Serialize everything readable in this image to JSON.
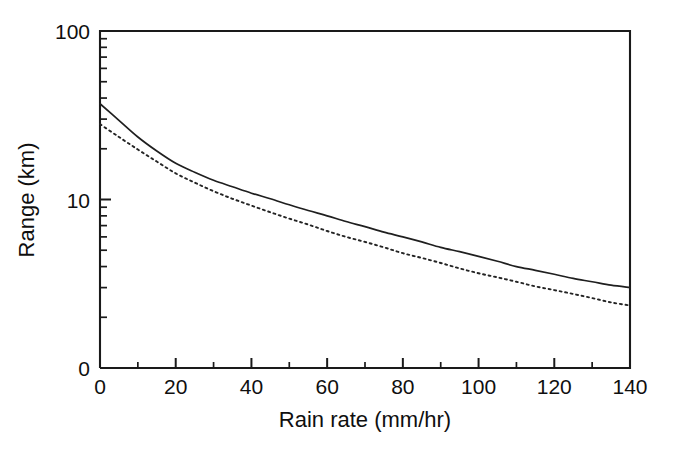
{
  "figure": {
    "background_color": "#ffffff",
    "ink_color": "#1a1a1a",
    "style": "scanned-monochrome-line-figure"
  },
  "chart_data": {
    "type": "line",
    "title": "",
    "subtitle": "",
    "xlabel": "Rain rate (mm/hr)",
    "ylabel": "Range (km)",
    "xscale": "linear",
    "yscale": "log",
    "xlim": [
      0,
      140
    ],
    "ylim": [
      1,
      100
    ],
    "grid": false,
    "legend": "none",
    "x_ticks": [
      0,
      20,
      40,
      60,
      80,
      100,
      120,
      140
    ],
    "x_tick_labels": [
      "0",
      "20",
      "40",
      "60",
      "80",
      "100",
      "120",
      "140"
    ],
    "x_minor_ticks": [
      10,
      30,
      50,
      70,
      90,
      110,
      130
    ],
    "y_ticks": [
      100,
      10,
      1
    ],
    "y_tick_labels": [
      "100",
      "10",
      "0"
    ],
    "y_minor_ticks": [
      90,
      80,
      70,
      60,
      50,
      40,
      30,
      20,
      9,
      8,
      7,
      6,
      5,
      4,
      3,
      2
    ],
    "series": [
      {
        "name": "upper-curve",
        "linestyle": "solid",
        "color": "#1f1f1f",
        "x": [
          0,
          5,
          10,
          15,
          20,
          25,
          30,
          35,
          40,
          45,
          50,
          55,
          60,
          65,
          70,
          75,
          80,
          85,
          90,
          95,
          100,
          105,
          110,
          115,
          120,
          125,
          130,
          135,
          140
        ],
        "y": [
          37.0,
          29.5,
          23.5,
          19.4,
          16.4,
          14.5,
          13.0,
          11.9,
          10.9,
          10.1,
          9.3,
          8.6,
          8.0,
          7.4,
          6.9,
          6.4,
          6.0,
          5.6,
          5.2,
          4.9,
          4.6,
          4.3,
          4.0,
          3.8,
          3.6,
          3.4,
          3.25,
          3.1,
          3.0
        ]
      },
      {
        "name": "lower-curve",
        "linestyle": "dotted",
        "color": "#242424",
        "x": [
          0,
          5,
          10,
          15,
          20,
          25,
          30,
          35,
          40,
          45,
          50,
          55,
          60,
          65,
          70,
          75,
          80,
          85,
          90,
          95,
          100,
          105,
          110,
          115,
          120,
          125,
          130,
          135,
          140
        ],
        "y": [
          28.0,
          23.5,
          19.8,
          16.8,
          14.3,
          12.6,
          11.2,
          10.1,
          9.2,
          8.4,
          7.7,
          7.1,
          6.5,
          6.0,
          5.6,
          5.2,
          4.8,
          4.5,
          4.2,
          3.9,
          3.65,
          3.45,
          3.25,
          3.05,
          2.9,
          2.75,
          2.6,
          2.45,
          2.35
        ]
      }
    ]
  }
}
